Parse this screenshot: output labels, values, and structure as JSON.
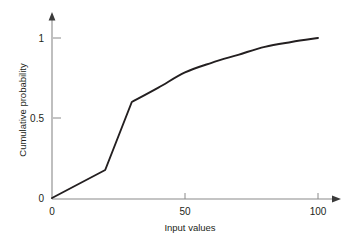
{
  "chart_data": {
    "type": "line",
    "title": "",
    "xlabel": "Input values",
    "ylabel": "Cumulative probability",
    "xlim": [
      0,
      100
    ],
    "ylim": [
      0,
      1
    ],
    "xticks": [
      "0",
      "50",
      "100"
    ],
    "xtick_values": [
      0,
      50,
      100
    ],
    "yticks": [
      "0",
      "0.5",
      "1"
    ],
    "ytick_values": [
      0,
      0.5,
      1
    ],
    "grid": false,
    "legend": null,
    "series": [
      {
        "name": "Cumulative probability",
        "color": "#231f20",
        "x": [
          0,
          20,
          30,
          40,
          50,
          60,
          70,
          80,
          90,
          100
        ],
        "y": [
          0,
          0.175,
          0.6,
          0.69,
          0.785,
          0.845,
          0.895,
          0.945,
          0.975,
          1.0
        ]
      }
    ]
  },
  "axes": {
    "x_title": "Input values",
    "y_title": "Cumulative probability",
    "x_tick_labels": [
      "0",
      "50",
      "100"
    ],
    "y_tick_labels": [
      "0",
      "0.5",
      "1"
    ]
  },
  "colors": {
    "background": "#ffffff",
    "line": "#231f20",
    "axis": "#8a8a8a",
    "text": "#231f20"
  }
}
